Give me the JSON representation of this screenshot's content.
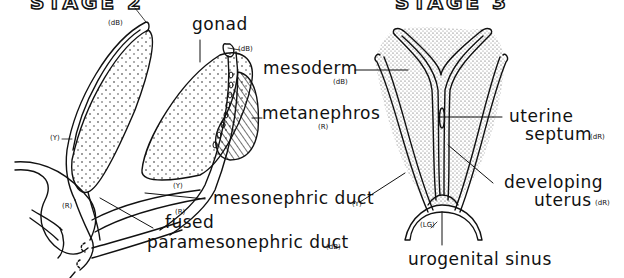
{
  "headings": {
    "left": "STAGE 2",
    "right": "STAGE 3"
  },
  "left_figure": {
    "labels": {
      "gonad": "gonad",
      "metanephros": "metanephros",
      "metanephros_code": "(R)",
      "mesonephric_duct": "mesonephric duct",
      "mesonephric_duct_code": "(Y)",
      "fused": "fused",
      "paramesonephric_duct": "paramesonephric duct",
      "paramesonephric_duct_code": "(dB)"
    },
    "color_codes": {
      "top_left_duct": "(dB)",
      "top_right_duct": "(dB)",
      "left_side": "(Y)",
      "middle_y": "(Y)",
      "middle_r": "(R)",
      "bottom_left_r": "(R)"
    }
  },
  "right_figure": {
    "labels": {
      "mesoderm": "mesoderm",
      "mesoderm_code": "(dB)",
      "uterine": "uterine",
      "septum": "septum",
      "septum_code": "(dR)",
      "developing": "developing",
      "uterus": "uterus",
      "uterus_code": "(dR)",
      "urogenital_sinus": "urogenital sinus",
      "sinus_code": "(LG)"
    }
  }
}
